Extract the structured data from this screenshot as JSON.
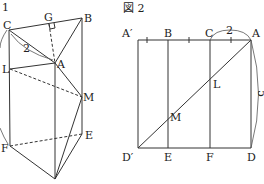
{
  "figure1": {
    "title": "1",
    "labels": {
      "C": "C",
      "G": "G",
      "B": "B",
      "A": "A",
      "L": "L",
      "M": "M",
      "E": "E",
      "F": "F"
    },
    "length_label": "2"
  },
  "figure2": {
    "title": "図 2",
    "labels": {
      "A_prime": "A′",
      "B": "B",
      "C": "C",
      "A": "A",
      "L": "L",
      "M": "M",
      "D_prime": "D′",
      "E": "E",
      "F": "F",
      "D": "D"
    },
    "length_label_top": "2",
    "length_label_side": "5"
  }
}
